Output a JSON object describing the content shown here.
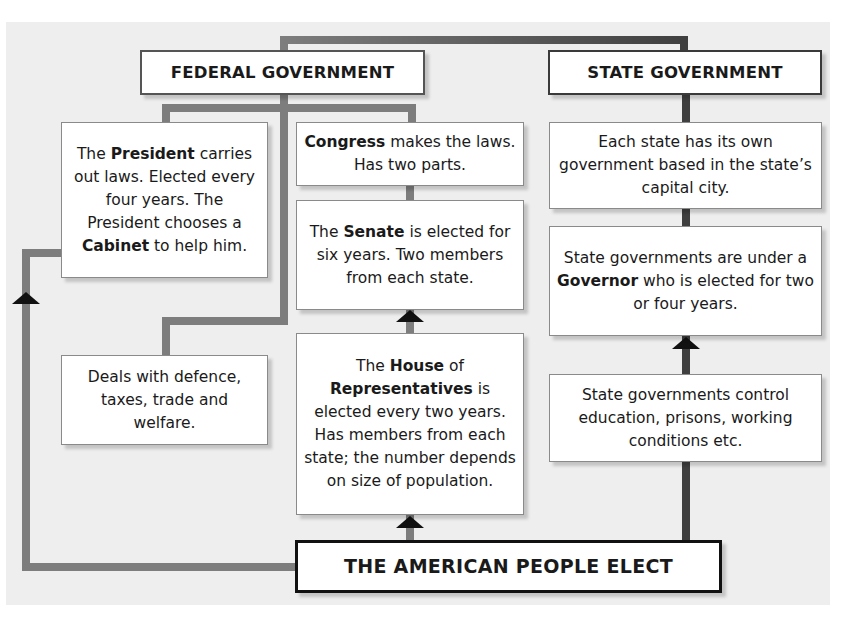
{
  "federal": {
    "title": "FEDERAL GOVERNMENT",
    "president": {
      "pre": "The ",
      "bold": "President",
      "post": " carries out laws. Elected every four years. The President chooses a ",
      "bold2": "Cabinet",
      "post2": " to help him."
    },
    "duties": "Deals with defence, taxes, trade and welfare.",
    "congress": {
      "bold": "Congress",
      "post": " makes the laws. Has two parts."
    },
    "senate": {
      "pre": "The ",
      "bold": "Senate",
      "post": " is elected for six years. Two members from each state."
    },
    "house": {
      "pre": "The ",
      "bold": "House",
      "mid": " of ",
      "bold2": "Representatives",
      "post": " is elected every two years. Has members from each state; the number depends on size of population."
    }
  },
  "state": {
    "title": "STATE GOVERNMENT",
    "capital": "Each state has its own government based in the state’s capital city.",
    "governor": {
      "pre": "State governments are under a ",
      "bold": "Governor",
      "post": " who is elected for two or four years."
    },
    "control": "State governments control education, prisons, working conditions etc."
  },
  "people": {
    "title": "THE AMERICAN PEOPLE ELECT"
  },
  "colors": {
    "panel": "#eeeeee",
    "federal_line": "#7d7d7d",
    "state_line": "#3f3f3f",
    "arrow": "#111111"
  }
}
